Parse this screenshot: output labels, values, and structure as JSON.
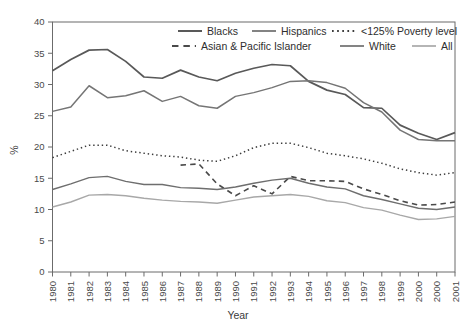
{
  "chart_data": {
    "type": "line",
    "title": "",
    "xlabel": "Year",
    "ylabel": "%",
    "ylim": [
      0,
      40
    ],
    "ytick_values": [
      0,
      5,
      10,
      15,
      20,
      25,
      30,
      35,
      40
    ],
    "grid": false,
    "legend_position": "top-right-inside",
    "categories": [
      "1980",
      "1981",
      "1982",
      "1983",
      "1984",
      "1985",
      "1986",
      "1987",
      "1988",
      "1989",
      "1990",
      "1991",
      "1992",
      "1993",
      "1994",
      "1995",
      "1996",
      "1997",
      "1998",
      "1999",
      "2000",
      "2000",
      "2001"
    ],
    "series": [
      {
        "name": "Blacks",
        "style": "solid",
        "color": "#595959",
        "width": 1.7,
        "values": [
          32.2,
          34.0,
          35.5,
          35.6,
          33.7,
          31.2,
          31.0,
          32.3,
          31.2,
          30.6,
          31.8,
          32.6,
          33.2,
          33.0,
          30.5,
          29.1,
          28.4,
          26.3,
          26.2,
          23.5,
          22.2,
          21.2,
          22.3
        ]
      },
      {
        "name": "Hispanics",
        "style": "solid",
        "color": "#757575",
        "width": 1.5,
        "values": [
          25.7,
          26.4,
          29.8,
          27.9,
          28.2,
          29.0,
          27.3,
          28.1,
          26.6,
          26.2,
          28.1,
          28.7,
          29.5,
          30.5,
          30.6,
          30.3,
          29.4,
          27.1,
          25.6,
          22.7,
          21.2,
          21.0,
          21.0
        ]
      },
      {
        "name": "<125% Poverty level",
        "style": "dotted",
        "color": "#3c3c3c",
        "width": 1.5,
        "values": [
          18.3,
          19.3,
          20.3,
          20.3,
          19.4,
          19.0,
          18.6,
          18.4,
          17.9,
          17.7,
          18.6,
          19.9,
          20.6,
          20.6,
          19.9,
          19.0,
          18.6,
          18.1,
          17.4,
          16.5,
          15.9,
          15.5,
          15.9
        ]
      },
      {
        "name": "Asian & Pacific Islander",
        "style": "dashed",
        "color": "#4a4a4a",
        "width": 1.6,
        "start_index": 7,
        "values": [
          null,
          null,
          null,
          null,
          null,
          null,
          null,
          17.1,
          17.3,
          14.1,
          12.2,
          13.8,
          12.5,
          15.3,
          14.6,
          14.6,
          14.5,
          13.3,
          12.4,
          11.4,
          10.7,
          10.8,
          11.2
        ]
      },
      {
        "name": "White",
        "style": "solid",
        "color": "#6e6e6e",
        "width": 1.4,
        "values": [
          13.2,
          14.1,
          15.1,
          15.3,
          14.5,
          14.0,
          14.0,
          13.5,
          13.4,
          13.2,
          13.6,
          14.2,
          14.7,
          15.0,
          14.2,
          13.6,
          13.3,
          12.2,
          11.6,
          10.9,
          10.2,
          10.0,
          10.4
        ]
      },
      {
        "name": "All",
        "style": "solid",
        "color": "#a8a8a8",
        "width": 1.4,
        "values": [
          10.4,
          11.2,
          12.3,
          12.4,
          12.2,
          11.8,
          11.5,
          11.3,
          11.2,
          11.0,
          11.5,
          12.0,
          12.2,
          12.4,
          12.1,
          11.4,
          11.1,
          10.3,
          9.9,
          9.1,
          8.4,
          8.5,
          8.9
        ]
      }
    ]
  },
  "legend": {
    "items": [
      {
        "label": "Blacks",
        "style": "solid",
        "color": "#595959"
      },
      {
        "label": "Hispanics",
        "style": "solid",
        "color": "#757575"
      },
      {
        "label": "<125% Poverty level",
        "style": "dotted",
        "color": "#3c3c3c"
      },
      {
        "label": "Asian & Pacific Islander",
        "style": "dashed",
        "color": "#4a4a4a"
      },
      {
        "label": "White",
        "style": "solid",
        "color": "#6e6e6e"
      },
      {
        "label": "All",
        "style": "solid",
        "color": "#a8a8a8"
      }
    ]
  }
}
